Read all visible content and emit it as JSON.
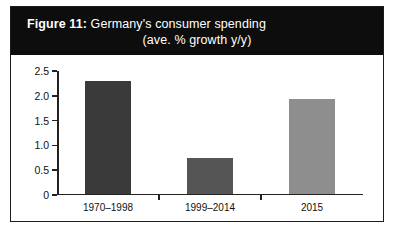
{
  "figure": {
    "title_label": "Figure 11:",
    "title_rest": " Germany's consumer spending",
    "subtitle": "(ave. % growth y/y)",
    "title_band_color": "#0d0d0d",
    "title_text_color": "#ffffff",
    "frame_border_color": "#1c1c1c",
    "background_color": "#ffffff"
  },
  "chart_data": {
    "type": "bar",
    "title": "Figure 11: Germany's consumer spending (ave. % growth y/y)",
    "xlabel": "",
    "ylabel": "",
    "categories": [
      "1970–1998",
      "1999–2014",
      "2015"
    ],
    "values": [
      2.3,
      0.75,
      1.93
    ],
    "colors": [
      "#3a3a3a",
      "#555555",
      "#8e8e8e"
    ],
    "ylim": [
      0,
      2.5
    ],
    "yticks": [
      0,
      0.5,
      1.0,
      1.5,
      2.0,
      2.5
    ],
    "ytick_labels": [
      "0",
      "0.5",
      "1.0",
      "1.5",
      "2.0",
      "2.5"
    ],
    "grid": false,
    "legend": false
  }
}
